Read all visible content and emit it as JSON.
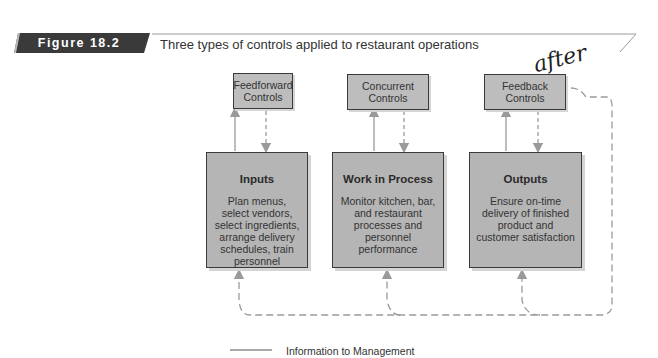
{
  "figure": {
    "label": "Figure 18.2",
    "title": "Three types of controls applied to restaurant operations",
    "banner_color": "#3a3a3a"
  },
  "controls": [
    {
      "name": "Feedforward",
      "line2": "Controls",
      "label": "Feedforward Controls"
    },
    {
      "name": "Concurrent",
      "line2": "Controls",
      "label": "Concurrent Controls"
    },
    {
      "name": "Feedback",
      "line2": "Controls",
      "label": "Feedback Controls"
    }
  ],
  "stages": [
    {
      "heading": "Inputs",
      "description": "Plan menus, select vendors, select ingredients, arrange delivery schedules, train personnel"
    },
    {
      "heading": "Work in Process",
      "description": "Monitor kitchen, bar, and restaurant processes and personnel performance"
    },
    {
      "heading": "Outputs",
      "description": "Ensure on-time delivery of finished product and customer satisfaction"
    }
  ],
  "legend": {
    "solid_line": "Information to Management"
  },
  "annotation": {
    "handwritten": "after"
  },
  "colors": {
    "box_fill": "#b5b5b5",
    "small_box_fill": "#bdbdbd",
    "border": "#3a3a3a",
    "arrow": "#9a9a9a"
  }
}
